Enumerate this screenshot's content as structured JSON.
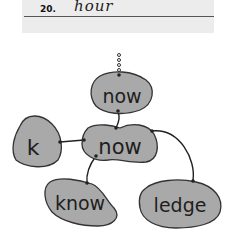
{
  "worksheet": {
    "item_number": "20.",
    "cursive_word": "hour",
    "background": "#ececec"
  },
  "diagram": {
    "blob_color": "#a9a9a9",
    "nodes": [
      {
        "id": "top",
        "label": "now"
      },
      {
        "id": "center",
        "label": "now"
      },
      {
        "id": "left",
        "label": "k"
      },
      {
        "id": "bottom-left",
        "label": "know"
      },
      {
        "id": "bottom-right",
        "label": "ledge"
      }
    ],
    "connections": [
      {
        "from": "top",
        "to": "center"
      },
      {
        "from": "left",
        "to": "center"
      },
      {
        "from": "center",
        "to": "bottom-left"
      },
      {
        "from": "center",
        "to": "bottom-right"
      }
    ]
  }
}
